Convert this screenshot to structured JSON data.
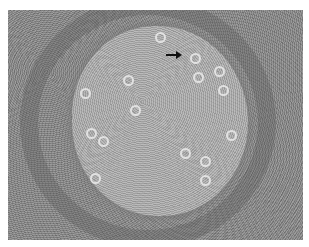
{
  "image": {
    "description": "Grayscale histology micrograph showing a round pale germinal center surrounded by a darker dense cell mantle",
    "colors": {
      "background": "#8a8a8a",
      "center": "#b2b2b2",
      "border": "#ffffff",
      "arrow": "#111111"
    },
    "annotation": {
      "type": "arrow",
      "direction": "right",
      "label": ""
    }
  }
}
